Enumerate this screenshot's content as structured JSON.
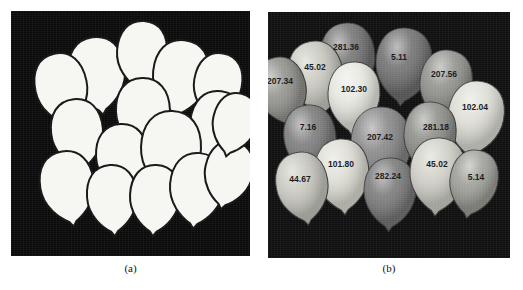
{
  "figure": {
    "panels": [
      {
        "id": "a",
        "caption": "(a)",
        "description": "binary-segmented-balloons",
        "background": "#0a0a0a",
        "fill": "#f6f6f2",
        "outline": "#141414"
      },
      {
        "id": "b",
        "caption": "(b)",
        "description": "labeled-grayscale-balloons",
        "background": "#0f0f0f"
      }
    ]
  },
  "chart_data": {
    "type": "scatter",
    "title": "",
    "xlabel": "",
    "ylabel": "",
    "categories": [
      "b1",
      "b2",
      "b3",
      "b4",
      "b5",
      "b6",
      "b7",
      "b8",
      "b9",
      "b10",
      "b11",
      "b12",
      "b13",
      "b14",
      "b15",
      "b16"
    ],
    "values": [
      281.36,
      45.02,
      207.34,
      102.3,
      5.11,
      207.56,
      102.04,
      7.16,
      207.42,
      281.18,
      101.8,
      44.67,
      282.24,
      45.02,
      5.14,
      0
    ],
    "labels": [
      "281.36",
      "45.02",
      "207.34",
      "102.30",
      "5.11",
      "207.56",
      "102.04",
      "7.16",
      "207.42",
      "281.18",
      "101.80",
      "44.67",
      "282.24",
      "45.02",
      "5.14"
    ]
  },
  "panel_a": {
    "caption": "(a)",
    "balloons": [
      {
        "cx": 86,
        "cy": 60,
        "rx": 28,
        "ry": 34,
        "rot": -8
      },
      {
        "cx": 131,
        "cy": 41,
        "rx": 25,
        "ry": 31,
        "rot": 4
      },
      {
        "cx": 50,
        "cy": 75,
        "rx": 26,
        "ry": 33,
        "rot": -12
      },
      {
        "cx": 170,
        "cy": 63,
        "rx": 28,
        "ry": 34,
        "rot": 6
      },
      {
        "cx": 207,
        "cy": 72,
        "rx": 24,
        "ry": 30,
        "rot": 10
      },
      {
        "cx": 132,
        "cy": 100,
        "rx": 27,
        "ry": 33,
        "rot": -2
      },
      {
        "cx": 206,
        "cy": 113,
        "rx": 27,
        "ry": 33,
        "rot": 8
      },
      {
        "cx": 66,
        "cy": 120,
        "rx": 26,
        "ry": 32,
        "rot": -6
      },
      {
        "cx": 111,
        "cy": 145,
        "rx": 26,
        "ry": 32,
        "rot": -3
      },
      {
        "cx": 160,
        "cy": 137,
        "rx": 30,
        "ry": 37,
        "rot": 2
      },
      {
        "cx": 56,
        "cy": 173,
        "rx": 27,
        "ry": 33,
        "rot": -9
      },
      {
        "cx": 101,
        "cy": 185,
        "rx": 25,
        "ry": 31,
        "rot": -4
      },
      {
        "cx": 144,
        "cy": 185,
        "rx": 25,
        "ry": 31,
        "rot": 3
      },
      {
        "cx": 186,
        "cy": 175,
        "rx": 27,
        "ry": 33,
        "rot": 5
      },
      {
        "cx": 218,
        "cy": 160,
        "rx": 24,
        "ry": 30,
        "rot": 12
      },
      {
        "cx": 224,
        "cy": 110,
        "rx": 22,
        "ry": 28,
        "rot": 14
      }
    ]
  },
  "panel_b": {
    "caption": "(b)",
    "balloons": [
      {
        "cx": 80,
        "cy": 44,
        "rx": 27,
        "ry": 33,
        "rot": -5,
        "tone": "#6f6f6f",
        "label": "281.36",
        "lx": 78,
        "ly": 38
      },
      {
        "cx": 48,
        "cy": 62,
        "rx": 27,
        "ry": 33,
        "rot": -10,
        "tone": "#c8c8c0",
        "label": "45.02",
        "lx": 47,
        "ly": 58
      },
      {
        "cx": 13,
        "cy": 76,
        "rx": 25,
        "ry": 31,
        "rot": -14,
        "tone": "#8f8f8a",
        "label": "207.34",
        "lx": 12,
        "ly": 72
      },
      {
        "cx": 86,
        "cy": 82,
        "rx": 26,
        "ry": 32,
        "rot": 3,
        "tone": "#e6e6df",
        "label": "102.30",
        "lx": 86,
        "ly": 80
      },
      {
        "cx": 136,
        "cy": 50,
        "rx": 28,
        "ry": 34,
        "rot": 5,
        "tone": "#6b6b6b",
        "label": "5.11",
        "lx": 131,
        "ly": 48
      },
      {
        "cx": 178,
        "cy": 70,
        "rx": 26,
        "ry": 32,
        "rot": 9,
        "tone": "#8d8d88",
        "label": "207.56",
        "lx": 176,
        "ly": 65
      },
      {
        "cx": 208,
        "cy": 103,
        "rx": 28,
        "ry": 34,
        "rot": 10,
        "tone": "#ddddd5",
        "label": "102.04",
        "lx": 207,
        "ly": 98
      },
      {
        "cx": 42,
        "cy": 125,
        "rx": 26,
        "ry": 32,
        "rot": -7,
        "tone": "#777777",
        "label": "7.16",
        "lx": 40,
        "ly": 118
      },
      {
        "cx": 113,
        "cy": 132,
        "rx": 30,
        "ry": 37,
        "rot": 0,
        "tone": "#828282",
        "label": "207.42",
        "lx": 112,
        "ly": 128
      },
      {
        "cx": 162,
        "cy": 122,
        "rx": 26,
        "ry": 32,
        "rot": 6,
        "tone": "#8a8a85",
        "label": "281.18",
        "lx": 168,
        "ly": 118
      },
      {
        "cx": 74,
        "cy": 160,
        "rx": 27,
        "ry": 33,
        "rot": -4,
        "tone": "#ddddd4",
        "label": "101.80",
        "lx": 73,
        "ly": 155
      },
      {
        "cx": 34,
        "cy": 172,
        "rx": 26,
        "ry": 32,
        "rot": -9,
        "tone": "#c6c6be",
        "label": "44.67",
        "lx": 32,
        "ly": 170
      },
      {
        "cx": 122,
        "cy": 178,
        "rx": 26,
        "ry": 32,
        "rot": 2,
        "tone": "#757575",
        "label": "282.24",
        "lx": 120,
        "ly": 167
      },
      {
        "cx": 170,
        "cy": 160,
        "rx": 28,
        "ry": 34,
        "rot": 4,
        "tone": "#cfcfc7",
        "label": "45.02",
        "lx": 169,
        "ly": 155
      },
      {
        "cx": 206,
        "cy": 168,
        "rx": 24,
        "ry": 30,
        "rot": 11,
        "tone": "#9b9b95",
        "label": "5.14",
        "lx": 208,
        "ly": 168
      }
    ]
  }
}
